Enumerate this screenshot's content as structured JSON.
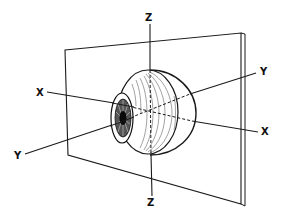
{
  "diagram": {
    "axes": [
      {
        "name": "Z",
        "role": "vertical axis",
        "labels": [
          "Z",
          "Z"
        ]
      },
      {
        "name": "X",
        "role": "horizontal transverse axis",
        "labels": [
          "X",
          "X"
        ]
      },
      {
        "name": "Y",
        "role": "antero-posterior (visual) axis",
        "labels": [
          "Y",
          "Y"
        ]
      }
    ],
    "elements": [
      "eyeball",
      "cornea-iris",
      "equatorial-plane"
    ],
    "colors": {
      "ink": "#1a1a1a",
      "background": "#ffffff"
    }
  }
}
